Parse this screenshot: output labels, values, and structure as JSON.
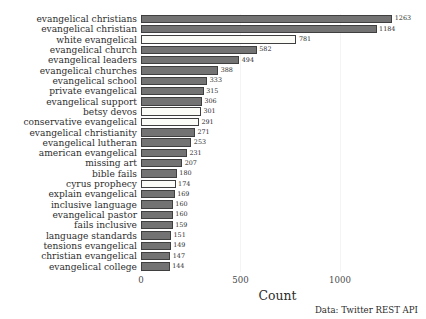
{
  "chart_data": {
    "type": "bar",
    "orientation": "horizontal",
    "title": "",
    "xlabel": "Count",
    "ylabel": "",
    "xlim": [
      0,
      1372
    ],
    "xticks": [
      0,
      500,
      1000
    ],
    "xtick_labels": [
      "0",
      "500",
      "1000"
    ],
    "grid": true,
    "grid_axis": "x",
    "legend": "none",
    "caption": "Data: Twitter REST API",
    "bar_color": "#737373",
    "highlight_color": "#fbfbf7",
    "edge_color": "#3f3f3f",
    "categories": [
      "evangelical christians",
      "evangelical christian",
      "white evangelical",
      "evangelical church",
      "evangelical leaders",
      "evangelical churches",
      "evangelical school",
      "private evangelical",
      "evangelical support",
      "betsy devos",
      "conservative evangelical",
      "evangelical christianity",
      "evangelical lutheran",
      "american evangelical",
      "missing art",
      "bible fails",
      "cyrus prophecy",
      "explain evangelical",
      "inclusive language",
      "evangelical pastor",
      "fails inclusive",
      "language standards",
      "tensions evangelical",
      "christian evangelical",
      "evangelical college"
    ],
    "values": [
      1263,
      1184,
      781,
      582,
      494,
      388,
      333,
      315,
      306,
      301,
      291,
      271,
      253,
      231,
      207,
      180,
      174,
      169,
      160,
      160,
      159,
      151,
      149,
      147,
      144
    ],
    "highlighted": [
      false,
      false,
      true,
      false,
      false,
      false,
      false,
      false,
      false,
      true,
      true,
      false,
      false,
      false,
      false,
      false,
      true,
      false,
      false,
      false,
      false,
      false,
      false,
      false,
      false
    ]
  }
}
